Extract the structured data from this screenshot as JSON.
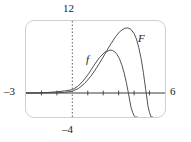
{
  "figure": {
    "frame_color": "#cfcfcf",
    "axis_color": "#3a3a3a",
    "curve_color": "#4a4a4a",
    "background": "#ffffff"
  },
  "labels": {
    "y_max": "12",
    "y_min": "–4",
    "x_min": "–3",
    "x_max": "6",
    "curve_f": "f",
    "curve_F": "F"
  },
  "chart_data": {
    "type": "line",
    "title": "",
    "xlabel": "",
    "ylabel": "",
    "xlim": [
      -3,
      6
    ],
    "ylim": [
      -4,
      12
    ],
    "grid": false,
    "legend": "inline-curve-labels",
    "axes": {
      "x_axis": {
        "style": "solid",
        "y_value": 0,
        "tick_values": [
          -2,
          -1,
          1,
          2,
          3,
          4,
          5
        ]
      },
      "y_axis": {
        "style": "dotted",
        "x_value": 0,
        "tick_values": []
      }
    },
    "tick_labels": {
      "x": [
        "-3",
        "6"
      ],
      "y": [
        "12",
        "-4"
      ]
    },
    "series": [
      {
        "name": "f",
        "label": "f",
        "label_position": {
          "x": 1.05,
          "y": 6.1
        },
        "x": [
          -3.0,
          -2.5,
          -2.0,
          -1.5,
          -1.0,
          -0.5,
          0.0,
          0.35,
          0.7,
          1.05,
          1.4,
          1.75,
          2.1,
          2.45,
          2.6,
          2.75,
          2.9,
          3.05,
          3.2,
          3.35,
          3.5,
          3.6,
          3.7,
          3.8,
          3.9,
          4.0,
          4.1,
          4.2
        ],
        "y": [
          0.0,
          0.02,
          0.05,
          0.1,
          0.2,
          0.35,
          0.55,
          1.1,
          2.0,
          3.2,
          4.6,
          5.9,
          6.8,
          7.15,
          7.1,
          6.85,
          6.4,
          5.7,
          4.7,
          3.4,
          1.7,
          0.4,
          -1.0,
          -2.4,
          -3.2,
          -3.8,
          -4.0,
          -4.0
        ]
      },
      {
        "name": "F",
        "label": "F",
        "label_position": {
          "x": 4.2,
          "y": 9.2
        },
        "x": [
          -3.0,
          -2.5,
          -2.0,
          -1.5,
          -1.0,
          -0.5,
          0.0,
          0.4,
          0.8,
          1.2,
          1.6,
          2.0,
          2.4,
          2.8,
          3.1,
          3.4,
          3.6,
          3.8,
          4.0,
          4.15,
          4.3,
          4.45,
          4.6,
          4.75,
          4.9,
          5.0,
          5.1,
          5.2
        ],
        "y": [
          0.0,
          0.0,
          0.0,
          0.02,
          0.05,
          0.12,
          0.3,
          0.75,
          1.6,
          2.8,
          4.3,
          6.0,
          7.8,
          9.4,
          10.3,
          10.8,
          10.85,
          10.6,
          9.9,
          9.0,
          7.6,
          5.8,
          3.4,
          0.6,
          -2.2,
          -3.3,
          -4.0,
          -4.0
        ]
      }
    ]
  }
}
